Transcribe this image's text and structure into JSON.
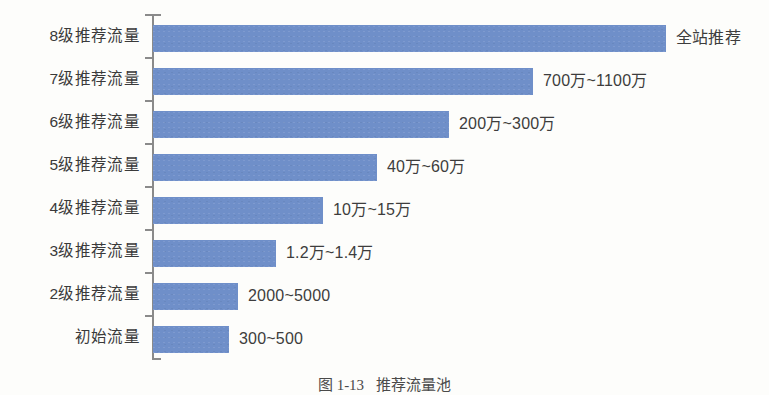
{
  "figure": {
    "caption_number": "图 1-13",
    "caption_text": "推荐流量池",
    "background_color": "#fdfdfb"
  },
  "chart_data": {
    "type": "bar",
    "orientation": "horizontal",
    "title": "",
    "subtitle": "",
    "xlabel": "",
    "ylabel": "",
    "grid": false,
    "legend": "none",
    "bar_color": "#6f8fc9",
    "axis_color": "#8a8a8a",
    "categories": [
      "8级推荐流量",
      "7级推荐流量",
      "6级推荐流量",
      "5级推荐流量",
      "4级推荐流量",
      "3级推荐流量",
      "2级推荐流量",
      "初始流量"
    ],
    "value_labels": [
      "全站推荐",
      "700万~1100万",
      "200万~300万",
      "40万~60万",
      "10万~15万",
      "1.2万~1.4万",
      "2000~5000",
      "300~500"
    ],
    "values": [
      513,
      380,
      296,
      224,
      170,
      123,
      85,
      76
    ],
    "xlim": [
      0,
      560
    ],
    "bars": [
      {
        "category": "8级推荐流量",
        "value": 513,
        "label": "全站推荐",
        "range_low": null,
        "range_high": null
      },
      {
        "category": "7级推荐流量",
        "value": 380,
        "label": "700万~1100万",
        "range_low": 7000000,
        "range_high": 11000000
      },
      {
        "category": "6级推荐流量",
        "value": 296,
        "label": "200万~300万",
        "range_low": 2000000,
        "range_high": 3000000
      },
      {
        "category": "5级推荐流量",
        "value": 224,
        "label": "40万~60万",
        "range_low": 400000,
        "range_high": 600000
      },
      {
        "category": "4级推荐流量",
        "value": 170,
        "label": "10万~15万",
        "range_low": 100000,
        "range_high": 150000
      },
      {
        "category": "3级推荐流量",
        "value": 123,
        "label": "1.2万~1.4万",
        "range_low": 12000,
        "range_high": 14000
      },
      {
        "category": "2级推荐流量",
        "value": 85,
        "label": "2000~5000",
        "range_low": 2000,
        "range_high": 5000
      },
      {
        "category": "初始流量",
        "value": 76,
        "label": "300~500",
        "range_low": 300,
        "range_high": 500
      }
    ]
  }
}
